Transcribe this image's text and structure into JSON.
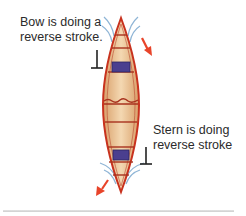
{
  "diagram": {
    "bow_label": [
      "Bow is doing a",
      "reverse stroke."
    ],
    "stern_label": [
      "Stern is doing",
      "reverse stroke"
    ],
    "colors": {
      "hull_outline": "#c8321e",
      "hull_fill_light": "#f2d2a8",
      "hull_fill_dark": "#d9a06a",
      "seat": "#4a3f8f",
      "thwart": "#a8321e",
      "water_wake": "#8fb5d6",
      "arrow": "#e8442a",
      "paddle_symbol": "#222222"
    },
    "arrows": [
      {
        "name": "bow-movement-arrow",
        "direction": "down-right"
      },
      {
        "name": "stern-movement-arrow",
        "direction": "down-left"
      }
    ],
    "paddle_symbols": [
      {
        "name": "bow-paddle-symbol",
        "side": "left"
      },
      {
        "name": "stern-paddle-symbol",
        "side": "right"
      }
    ]
  }
}
